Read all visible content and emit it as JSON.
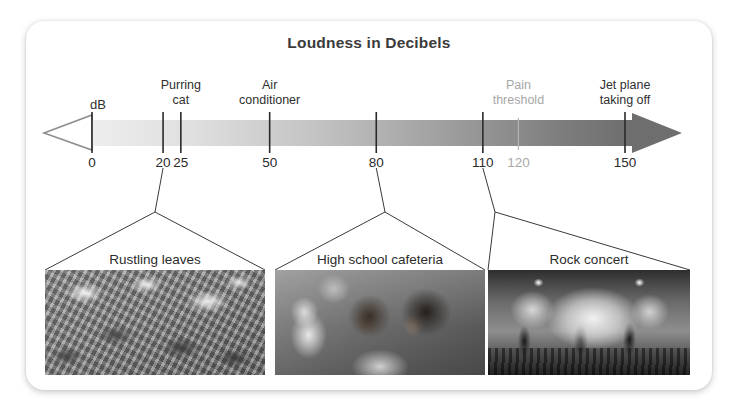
{
  "card": {
    "title": "Loudness in Decibels"
  },
  "scale": {
    "unit_label": "dB",
    "axis_min": 0,
    "axis_max": 150,
    "ticks": [
      {
        "value": "0",
        "db": 0,
        "muted": false
      },
      {
        "value": "20",
        "db": 20,
        "muted": false
      },
      {
        "value": "25",
        "db": 25,
        "muted": false
      },
      {
        "value": "50",
        "db": 50,
        "muted": false
      },
      {
        "value": "80",
        "db": 80,
        "muted": false
      },
      {
        "value": "110",
        "db": 110,
        "muted": false
      },
      {
        "value": "120",
        "db": 120,
        "muted": true
      },
      {
        "value": "150",
        "db": 150,
        "muted": false
      }
    ],
    "labels": [
      {
        "lines": [
          "Purring",
          "cat"
        ],
        "db": 25,
        "muted": false
      },
      {
        "lines": [
          "Air",
          "conditioner"
        ],
        "db": 50,
        "muted": false
      },
      {
        "lines": [
          "Pain",
          "threshold"
        ],
        "db": 120,
        "muted": true
      },
      {
        "lines": [
          "Jet plane",
          "taking off"
        ],
        "db": 150,
        "muted": false
      }
    ]
  },
  "photos": [
    {
      "caption": "Rustling leaves",
      "db": 20
    },
    {
      "caption": "High school cafeteria",
      "db": 80
    },
    {
      "caption": "Rock concert",
      "db": 110
    }
  ],
  "colors": {
    "bar_light": "#e8e8e8",
    "bar_dark": "#6e6e6e",
    "arrow_fill": "#6e6e6e",
    "outline": "#8a8a8a",
    "text": "#2b2b2b",
    "muted_text": "#a9a9a9"
  },
  "chart_data": {
    "type": "bar",
    "title": "Loudness in Decibels",
    "xlabel": "dB",
    "ylabel": "",
    "xlim": [
      0,
      150
    ],
    "grid": false,
    "legend": "none",
    "categories": [
      "Rustling leaves",
      "Purring cat",
      "Air conditioner",
      "High school cafeteria",
      "Rock concert",
      "Pain threshold",
      "Jet plane taking off"
    ],
    "values": [
      20,
      25,
      50,
      80,
      110,
      120,
      150
    ],
    "annotations": [
      {
        "text": "Rustling leaves",
        "x": 20
      },
      {
        "text": "Purring cat",
        "x": 25
      },
      {
        "text": "Air conditioner",
        "x": 50
      },
      {
        "text": "High school cafeteria",
        "x": 80
      },
      {
        "text": "Rock concert",
        "x": 110
      },
      {
        "text": "Pain threshold",
        "x": 120
      },
      {
        "text": "Jet plane taking off",
        "x": 150
      }
    ],
    "tick_labels": [
      "0",
      "20",
      "25",
      "50",
      "80",
      "110",
      "120",
      "150"
    ]
  }
}
